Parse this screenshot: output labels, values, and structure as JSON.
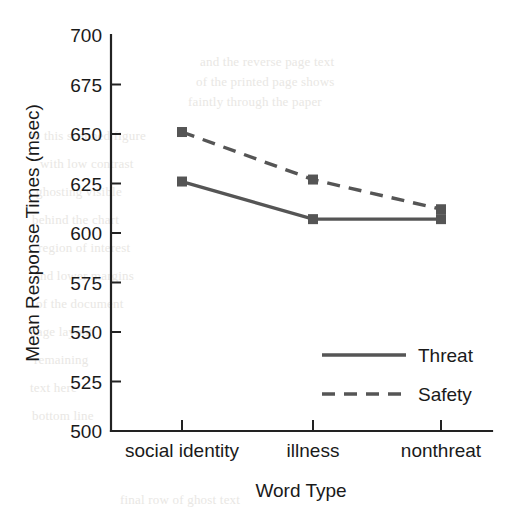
{
  "chart_data": {
    "type": "line",
    "title": "",
    "xlabel": "Word Type",
    "ylabel": "Mean Response Times (msec)",
    "categories": [
      "social identity",
      "illness",
      "nonthreat"
    ],
    "series": [
      {
        "name": "Threat",
        "style": "solid",
        "marker": "square",
        "values": [
          626,
          607,
          607
        ]
      },
      {
        "name": "Safety",
        "style": "dashed",
        "marker": "square",
        "values": [
          651,
          627,
          612
        ]
      }
    ],
    "ylim": [
      500,
      700
    ],
    "ytick_step": 25,
    "yticks": [
      "700",
      "675",
      "650",
      "625",
      "600",
      "575",
      "550",
      "525",
      "500"
    ],
    "grid": false,
    "legend_position": "inside lower right",
    "line_color": "#555555",
    "axis_color": "#222222",
    "background_color": "#ffffff"
  },
  "legend": {
    "entries": [
      {
        "label": "Threat"
      },
      {
        "label": "Safety"
      }
    ]
  },
  "bleed_through": [
    {
      "text": "and the reverse page text",
      "x": 200,
      "y": 54
    },
    {
      "text": "of the printed page shows",
      "x": 196,
      "y": 74
    },
    {
      "text": "faintly through the paper",
      "x": 188,
      "y": 94
    },
    {
      "text": "in this scanned figure",
      "x": 30,
      "y": 128
    },
    {
      "text": "with low contrast",
      "x": 40,
      "y": 156
    },
    {
      "text": "ghosting visible",
      "x": 36,
      "y": 184
    },
    {
      "text": "behind the chart",
      "x": 32,
      "y": 212
    },
    {
      "text": "region of interest",
      "x": 38,
      "y": 240
    },
    {
      "text": "and lower margins",
      "x": 34,
      "y": 268
    },
    {
      "text": "of the document",
      "x": 36,
      "y": 296
    },
    {
      "text": "page layout",
      "x": 30,
      "y": 324
    },
    {
      "text": "remaining",
      "x": 34,
      "y": 352
    },
    {
      "text": "text here",
      "x": 30,
      "y": 380
    },
    {
      "text": "bottom line",
      "x": 32,
      "y": 408
    },
    {
      "text": "final row of ghost text",
      "x": 120,
      "y": 492
    }
  ]
}
